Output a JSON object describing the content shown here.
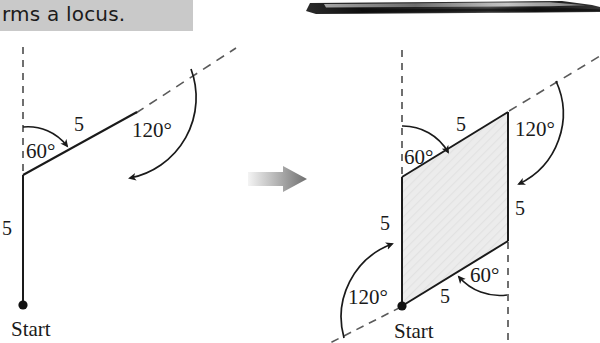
{
  "header": {
    "caption_text": "rms a locus.",
    "band_color": "#c9c9c9",
    "pencil_icon": "pencil-photo"
  },
  "transition": {
    "arrow_icon": "right-arrow-gradient",
    "color_from": "#efefef",
    "color_to": "#6e6e6e"
  },
  "diagrams": [
    {
      "id": "left-partial-path",
      "name": "partial-locus-path",
      "start_label": "Start",
      "segments": [
        {
          "name": "first-segment-up",
          "length_label": "5"
        },
        {
          "name": "second-segment-diagonal",
          "length_label": "5"
        }
      ],
      "angles": [
        {
          "name": "interior-angle-60",
          "label": "60°"
        },
        {
          "name": "exterior-turn-120",
          "label": "120°"
        }
      ],
      "dashed_lines": [
        "vertical-reference-dashed",
        "diagonal-extension-dashed"
      ]
    },
    {
      "id": "right-closed-rhombus",
      "name": "completed-locus-rhombus",
      "start_label": "Start",
      "fill_color": "#ececec",
      "segments": [
        {
          "name": "side-left-up",
          "length_label": "5"
        },
        {
          "name": "side-top-diagonal",
          "length_label": "5"
        },
        {
          "name": "side-right-down",
          "length_label": "5"
        },
        {
          "name": "side-bottom-diagonal",
          "length_label": "5"
        }
      ],
      "angles": [
        {
          "name": "angle-top-left-60",
          "label": "60°"
        },
        {
          "name": "angle-top-right-120",
          "label": "120°"
        },
        {
          "name": "angle-bottom-right-60",
          "label": "60°"
        },
        {
          "name": "angle-bottom-left-120",
          "label": "120°"
        }
      ],
      "dashed_lines": [
        "vertical-reference-dashed-left",
        "diagonal-extension-dashed-top",
        "vertical-reference-dashed-right",
        "diagonal-extension-dashed-bottom"
      ]
    }
  ]
}
